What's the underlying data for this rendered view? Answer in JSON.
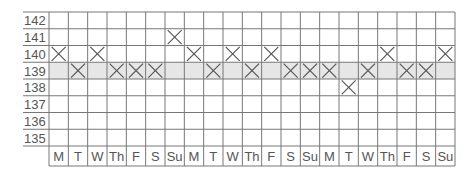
{
  "chart_data": {
    "type": "line",
    "title": "",
    "xlabel": "",
    "ylabel": "",
    "y_ticks": [
      142,
      141,
      140,
      139,
      138,
      137,
      136,
      135
    ],
    "ylim": [
      135,
      142
    ],
    "categories": [
      "M",
      "T",
      "W",
      "Th",
      "F",
      "S",
      "Su",
      "M",
      "T",
      "W",
      "Th",
      "F",
      "S",
      "Su",
      "M",
      "T",
      "W",
      "Th",
      "F",
      "S",
      "Su"
    ],
    "series": [
      {
        "name": "Daily reading",
        "marker": "x",
        "values": [
          140,
          139,
          140,
          139,
          139,
          139,
          141,
          140,
          139,
          140,
          139,
          140,
          139,
          139,
          139,
          138,
          139,
          140,
          139,
          139,
          140
        ]
      }
    ],
    "highlight_band": 139,
    "grid": true,
    "colors": {
      "grid": "#777777",
      "band": "#e6e6e6",
      "marker": "#555555",
      "text": "#555555"
    }
  }
}
